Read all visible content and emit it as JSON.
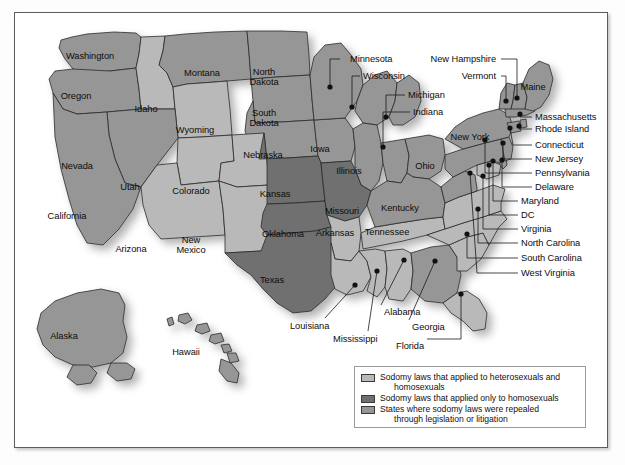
{
  "figure": {
    "kind": "thematic-choropleth-map"
  },
  "colors": {
    "both": "#b9b9b9",
    "homosexual_only": "#6f6f6f",
    "repealed": "#969696",
    "outline": "#2b2b2b",
    "background": "#ffffff",
    "frame": "#5c5c5c",
    "label_text": "#0d0d0d"
  },
  "legend": {
    "items": [
      {
        "swatch": "both",
        "line1": "Sodomy laws that applied to heterosexuals and",
        "line2": "homosexuals"
      },
      {
        "swatch": "homosexual_only",
        "line1": "Sodomy laws that applied only to homosexuals",
        "line2": ""
      },
      {
        "swatch": "repealed",
        "line1": "States where sodomy laws were repealed",
        "line2": "through legislation or litigation"
      }
    ]
  },
  "chart_data": {
    "type": "map",
    "legend_position": "bottom-right",
    "categories": [
      "both",
      "homosexual_only",
      "repealed"
    ],
    "states": [
      {
        "name": "Washington",
        "category": "repealed"
      },
      {
        "name": "Oregon",
        "category": "repealed"
      },
      {
        "name": "Idaho",
        "category": "both"
      },
      {
        "name": "Montana",
        "category": "repealed"
      },
      {
        "name": "Wyoming",
        "category": "both"
      },
      {
        "name": "North Dakota",
        "category": "repealed"
      },
      {
        "name": "South Dakota",
        "category": "repealed"
      },
      {
        "name": "Nebraska",
        "category": "repealed"
      },
      {
        "name": "Iowa",
        "category": "repealed"
      },
      {
        "name": "Minnesota",
        "category": "repealed"
      },
      {
        "name": "Wisconsin",
        "category": "repealed"
      },
      {
        "name": "Michigan",
        "category": "repealed"
      },
      {
        "name": "Illinois",
        "category": "repealed"
      },
      {
        "name": "Indiana",
        "category": "repealed"
      },
      {
        "name": "Ohio",
        "category": "repealed"
      },
      {
        "name": "Nevada",
        "category": "repealed"
      },
      {
        "name": "California",
        "category": "repealed"
      },
      {
        "name": "Utah",
        "category": "both"
      },
      {
        "name": "Colorado",
        "category": "both"
      },
      {
        "name": "Arizona",
        "category": "both"
      },
      {
        "name": "New Mexico",
        "category": "both"
      },
      {
        "name": "Kansas",
        "category": "homosexual_only"
      },
      {
        "name": "Oklahoma",
        "category": "homosexual_only"
      },
      {
        "name": "Texas",
        "category": "homosexual_only"
      },
      {
        "name": "Missouri",
        "category": "homosexual_only"
      },
      {
        "name": "Arkansas",
        "category": "both"
      },
      {
        "name": "Louisiana",
        "category": "both"
      },
      {
        "name": "Mississippi",
        "category": "both"
      },
      {
        "name": "Alabama",
        "category": "both"
      },
      {
        "name": "Tennessee",
        "category": "both"
      },
      {
        "name": "Kentucky",
        "category": "repealed"
      },
      {
        "name": "Georgia",
        "category": "repealed"
      },
      {
        "name": "Florida",
        "category": "both"
      },
      {
        "name": "South Carolina",
        "category": "both"
      },
      {
        "name": "North Carolina",
        "category": "both"
      },
      {
        "name": "Virginia",
        "category": "both"
      },
      {
        "name": "West Virginia",
        "category": "repealed"
      },
      {
        "name": "Maryland",
        "category": "both"
      },
      {
        "name": "DC",
        "category": "repealed"
      },
      {
        "name": "Delaware",
        "category": "repealed"
      },
      {
        "name": "Pennsylvania",
        "category": "repealed"
      },
      {
        "name": "New Jersey",
        "category": "repealed"
      },
      {
        "name": "New York",
        "category": "repealed"
      },
      {
        "name": "Connecticut",
        "category": "repealed"
      },
      {
        "name": "Rhode Island",
        "category": "repealed"
      },
      {
        "name": "Massachusetts",
        "category": "repealed"
      },
      {
        "name": "Vermont",
        "category": "repealed"
      },
      {
        "name": "New Hampshire",
        "category": "repealed"
      },
      {
        "name": "Maine",
        "category": "repealed"
      },
      {
        "name": "Alaska",
        "category": "repealed"
      },
      {
        "name": "Hawaii",
        "category": "repealed"
      }
    ]
  },
  "labels": {
    "inset": [
      {
        "name": "Washington",
        "text": "Washington",
        "x": 75,
        "y": 38
      },
      {
        "name": "Oregon",
        "text": "Oregon",
        "x": 61,
        "y": 78
      },
      {
        "name": "Idaho",
        "text": "Idaho",
        "x": 131,
        "y": 91
      },
      {
        "name": "Montana",
        "text": "Montana",
        "x": 187,
        "y": 55
      },
      {
        "name": "Wyoming",
        "text": "Wyoming",
        "x": 180,
        "y": 112
      },
      {
        "name": "North Dakota",
        "line1": "North",
        "line2": "Dakota",
        "x": 249,
        "y": 55
      },
      {
        "name": "South Dakota",
        "line1": "South",
        "line2": "Dakota",
        "x": 249,
        "y": 96
      },
      {
        "name": "Nebraska",
        "text": "Nebraska",
        "x": 248,
        "y": 137
      },
      {
        "name": "Iowa",
        "text": "Iowa",
        "x": 305,
        "y": 131
      },
      {
        "name": "Illinois",
        "text": "Illinois",
        "x": 334,
        "y": 153
      },
      {
        "name": "Ohio",
        "text": "Ohio",
        "x": 410,
        "y": 148
      },
      {
        "name": "Nevada",
        "text": "Nevada",
        "x": 62,
        "y": 148
      },
      {
        "name": "California",
        "text": "California",
        "x": 52,
        "y": 198
      },
      {
        "name": "Utah",
        "text": "Utah",
        "x": 115,
        "y": 169
      },
      {
        "name": "Colorado",
        "text": "Colorado",
        "x": 176,
        "y": 173
      },
      {
        "name": "Arizona",
        "text": "Arizona",
        "x": 116,
        "y": 231
      },
      {
        "name": "New Mexico",
        "line1": "New",
        "line2": "Mexico",
        "x": 176,
        "y": 223
      },
      {
        "name": "Kansas",
        "text": "Kansas",
        "x": 260,
        "y": 176
      },
      {
        "name": "Oklahoma",
        "line1": "Oklahoma",
        "x": 268,
        "y": 216
      },
      {
        "name": "Texas",
        "text": "Texas",
        "x": 257,
        "y": 262
      },
      {
        "name": "Missouri",
        "text": "Missouri",
        "x": 327,
        "y": 193
      },
      {
        "name": "Arkansas",
        "text": "Arkansas",
        "x": 320,
        "y": 215
      },
      {
        "name": "Tennessee",
        "text": "Tennessee",
        "x": 372,
        "y": 214
      },
      {
        "name": "Kentucky",
        "text": "Kentucky",
        "x": 385,
        "y": 190
      },
      {
        "name": "New York",
        "text": "New York",
        "x": 455,
        "y": 119
      },
      {
        "name": "Maine",
        "text": "Maine",
        "x": 518,
        "y": 69
      },
      {
        "name": "Alaska",
        "text": "Alaska",
        "x": 49,
        "y": 318
      },
      {
        "name": "Hawaii",
        "text": "Hawaii",
        "x": 171,
        "y": 334
      }
    ],
    "callouts": [
      {
        "name": "Minnesota",
        "text": "Minnesota",
        "tx": 335,
        "ty": 42,
        "anchor": "start",
        "lx1": 325,
        "ly1": 46,
        "lx2": 315,
        "ly2": 46,
        "dx": 315,
        "dy": 74
      },
      {
        "name": "Wisconsin",
        "text": "Wisconsin",
        "tx": 348,
        "ty": 59,
        "anchor": "start",
        "lx1": 345,
        "ly1": 63,
        "lx2": 337,
        "ly2": 63,
        "dx": 337,
        "dy": 94
      },
      {
        "name": "Michigan",
        "text": "Michigan",
        "tx": 393,
        "ty": 78,
        "anchor": "start",
        "lx1": 390,
        "ly1": 82,
        "lx2": 371,
        "ly2": 82,
        "dx": 371,
        "dy": 104
      },
      {
        "name": "Indiana",
        "text": "Indiana",
        "tx": 398,
        "ty": 95,
        "anchor": "start",
        "lx1": 395,
        "ly1": 99,
        "lx2": 368,
        "ly2": 99,
        "dx": 368,
        "dy": 134
      },
      {
        "name": "New Hampshire",
        "text": "New Hampshire",
        "tx": 481,
        "ty": 42,
        "anchor": "end",
        "lx1": 486,
        "ly1": 46,
        "lx2": 502,
        "ly2": 46,
        "dx": 502,
        "dy": 85
      },
      {
        "name": "Vermont",
        "text": "Vermont",
        "tx": 481,
        "ty": 59,
        "anchor": "end",
        "lx1": 486,
        "ly1": 63,
        "lx2": 491,
        "ly2": 63,
        "dx": 491,
        "dy": 88
      },
      {
        "name": "Massachusetts",
        "text": "Massachusetts",
        "tx": 520,
        "ty": 100,
        "anchor": "start",
        "lx1": 517,
        "ly1": 104,
        "lx2": 505,
        "ly2": 104,
        "dx": 505,
        "dy": 101
      },
      {
        "name": "Rhode Island",
        "text": "Rhode Island",
        "tx": 520,
        "ty": 112,
        "anchor": "start",
        "lx1": 517,
        "ly1": 116,
        "lx2": 504,
        "ly2": 116,
        "dx": 504,
        "dy": 113
      },
      {
        "name": "Connecticut",
        "text": "Connecticut",
        "tx": 520,
        "ty": 128,
        "anchor": "start",
        "lx1": 517,
        "ly1": 132,
        "lx2": 498,
        "ly2": 132,
        "dx": 495,
        "dy": 115
      },
      {
        "name": "New Jersey",
        "text": "New Jersey",
        "tx": 520,
        "ty": 142,
        "anchor": "start",
        "lx1": 517,
        "ly1": 146,
        "lx2": 488,
        "ly2": 146,
        "dx": 488,
        "dy": 130
      },
      {
        "name": "Pennsylvania",
        "text": "Pennsylvania",
        "tx": 520,
        "ty": 156,
        "anchor": "start",
        "lx1": 517,
        "ly1": 160,
        "lx2": 470,
        "ly2": 160,
        "dx": 470,
        "dy": 127
      },
      {
        "name": "Delaware",
        "text": "Delaware",
        "tx": 520,
        "ty": 170,
        "anchor": "start",
        "lx1": 517,
        "ly1": 174,
        "lx2": 487,
        "ly2": 174,
        "dx": 487,
        "dy": 147
      },
      {
        "name": "Maryland",
        "text": "Maryland",
        "tx": 506,
        "ty": 184,
        "anchor": "start",
        "lx1": 503,
        "ly1": 188,
        "lx2": 478,
        "ly2": 188,
        "dx": 478,
        "dy": 148
      },
      {
        "name": "DC",
        "text": "DC",
        "tx": 506,
        "ty": 198,
        "anchor": "start",
        "lx1": 503,
        "ly1": 202,
        "lx2": 474,
        "ly2": 202,
        "dx": 474,
        "dy": 152
      },
      {
        "name": "Virginia",
        "text": "Virginia",
        "tx": 506,
        "ty": 212,
        "anchor": "start",
        "lx1": 503,
        "ly1": 216,
        "lx2": 468,
        "ly2": 216,
        "dx": 468,
        "dy": 163
      },
      {
        "name": "North Carolina",
        "text": "North Carolina",
        "tx": 506,
        "ty": 226,
        "anchor": "start",
        "lx1": 503,
        "ly1": 230,
        "lx2": 463,
        "ly2": 230,
        "dx": 463,
        "dy": 196
      },
      {
        "name": "South Carolina",
        "text": "South Carolina",
        "tx": 506,
        "ty": 241,
        "anchor": "start",
        "lx1": 503,
        "ly1": 245,
        "lx2": 452,
        "ly2": 245,
        "dx": 452,
        "dy": 221
      },
      {
        "name": "West Virginia",
        "text": "West Virginia",
        "tx": 506,
        "ty": 256,
        "anchor": "start",
        "lx1": 503,
        "ly1": 260,
        "lx2": 462,
        "ly2": 260,
        "dx": 455,
        "dy": 160
      },
      {
        "name": "Alabama",
        "text": "Alabama",
        "tx": 369,
        "ty": 295,
        "anchor": "start",
        "lx1": 366,
        "ly1": 292,
        "lx2": 366,
        "ly2": 292,
        "dx": 389,
        "dy": 247
      },
      {
        "name": "Georgia",
        "text": "Georgia",
        "tx": 397,
        "ty": 310,
        "anchor": "start",
        "lx1": 394,
        "ly1": 307,
        "lx2": 394,
        "ly2": 307,
        "dx": 420,
        "dy": 248
      },
      {
        "name": "Florida",
        "text": "Florida",
        "tx": 381,
        "ty": 329,
        "anchor": "start",
        "lx1": 412,
        "ly1": 326,
        "lx2": 446,
        "ly2": 326,
        "dx": 446,
        "dy": 281
      },
      {
        "name": "Mississippi",
        "text": "Mississippi",
        "tx": 318,
        "ty": 322,
        "anchor": "start",
        "lx1": 353,
        "ly1": 318,
        "lx2": 353,
        "ly2": 318,
        "dx": 362,
        "dy": 258
      },
      {
        "name": "Louisiana",
        "text": "Louisiana",
        "tx": 275,
        "ty": 309,
        "anchor": "start",
        "lx1": 310,
        "ly1": 305,
        "lx2": 310,
        "ly2": 305,
        "dx": 340,
        "dy": 272
      }
    ]
  }
}
